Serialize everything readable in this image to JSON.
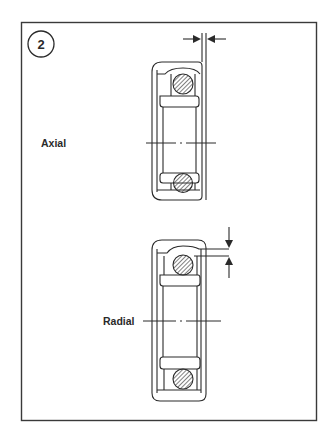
{
  "figure": {
    "number": "2",
    "labels": {
      "axial": "Axial",
      "radial": "Radial"
    },
    "stroke_color": "#2a2a2a",
    "hatch_color": "#4a4a4a"
  }
}
